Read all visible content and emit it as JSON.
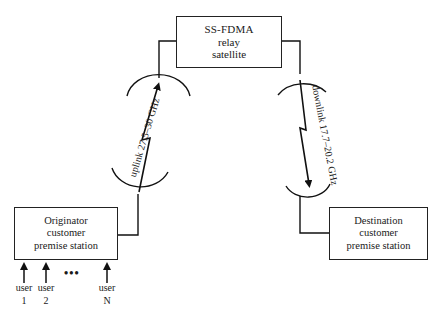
{
  "diagram": {
    "satellite": {
      "lines": [
        "SS-FDMA",
        "relay",
        "satellite"
      ]
    },
    "originator": {
      "lines": [
        "Originator",
        "customer",
        "premise station"
      ]
    },
    "destination": {
      "lines": [
        "Destination",
        "customer",
        "premise station"
      ]
    },
    "uplink_label": "uplink 27.5–30 GHz",
    "downlink_label": "downlink 17.7–20.2 GHz",
    "users": [
      {
        "label": "user",
        "id": "1"
      },
      {
        "label": "user",
        "id": "2"
      },
      {
        "label": "user",
        "id": "N"
      }
    ],
    "ellipsis": "•••"
  }
}
